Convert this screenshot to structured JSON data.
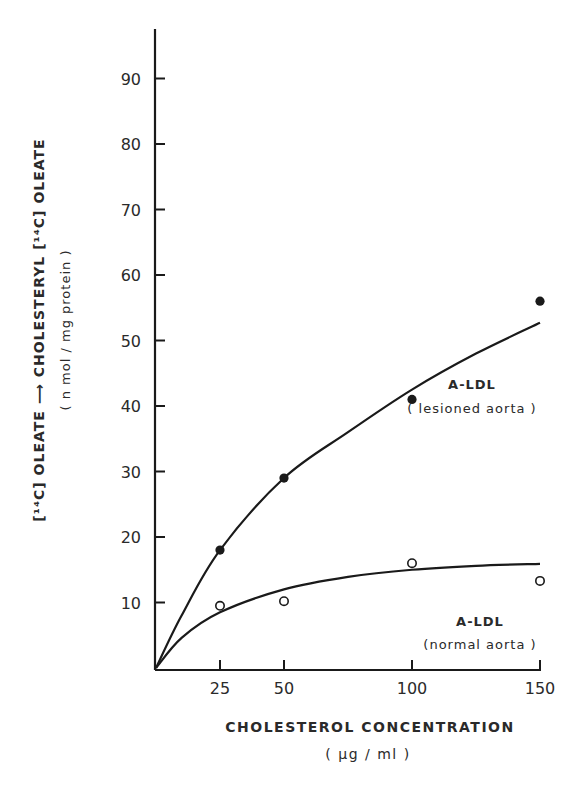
{
  "chart_data": {
    "type": "scatter",
    "title": "",
    "xlabel": "CHOLESTEROL CONCENTRATION",
    "xlabel_unit": "( μg / ml )",
    "ylabel": "[¹⁴C] OLEATE ⟶ CHOLESTERYL [¹⁴C] OLEATE",
    "ylabel_unit": "( n mol / mg protein )",
    "x_ticks": [
      25,
      50,
      100,
      150
    ],
    "y_ticks": [
      10,
      20,
      30,
      40,
      50,
      60,
      70,
      80,
      90
    ],
    "xlim": [
      0,
      150
    ],
    "ylim": [
      0,
      95
    ],
    "grid": false,
    "legend_position": "inline annotations next to curves",
    "x": [
      25,
      50,
      100,
      150
    ],
    "series": [
      {
        "name": "A-LDL (lesioned aorta)",
        "label_line1": "A-LDL",
        "label_line2": "( lesioned aorta )",
        "marker": "filled-circle",
        "values": [
          18,
          29,
          41,
          56
        ],
        "fit_curve": [
          [
            0,
            0
          ],
          [
            10,
            8
          ],
          [
            25,
            18
          ],
          [
            50,
            29
          ],
          [
            75,
            36
          ],
          [
            100,
            42.5
          ],
          [
            125,
            48
          ],
          [
            150,
            52.7
          ]
        ]
      },
      {
        "name": "A-LDL (normal aorta)",
        "label_line1": "A-LDL",
        "label_line2": "(normal aorta )",
        "marker": "open-circle",
        "values": [
          9.5,
          10.2,
          16,
          13.3
        ],
        "fit_curve": [
          [
            0,
            0
          ],
          [
            10,
            4.6
          ],
          [
            25,
            8.5
          ],
          [
            50,
            12
          ],
          [
            75,
            13.9
          ],
          [
            100,
            15
          ],
          [
            125,
            15.6
          ],
          [
            150,
            15.9
          ]
        ]
      }
    ]
  },
  "labels": {
    "ylabel_main": "[¹⁴C] OLEATE ⟶ CHOLESTERYL   [¹⁴C]  OLEATE",
    "ylabel_sub": "( n mol / mg protein )",
    "xlabel_main": "CHOLESTEROL CONCENTRATION",
    "xlabel_sub": "( μg / ml )",
    "lesioned_title": "A-LDL",
    "lesioned_sub": "( lesioned aorta )",
    "normal_title": "A-LDL",
    "normal_sub": "(normal aorta )"
  }
}
